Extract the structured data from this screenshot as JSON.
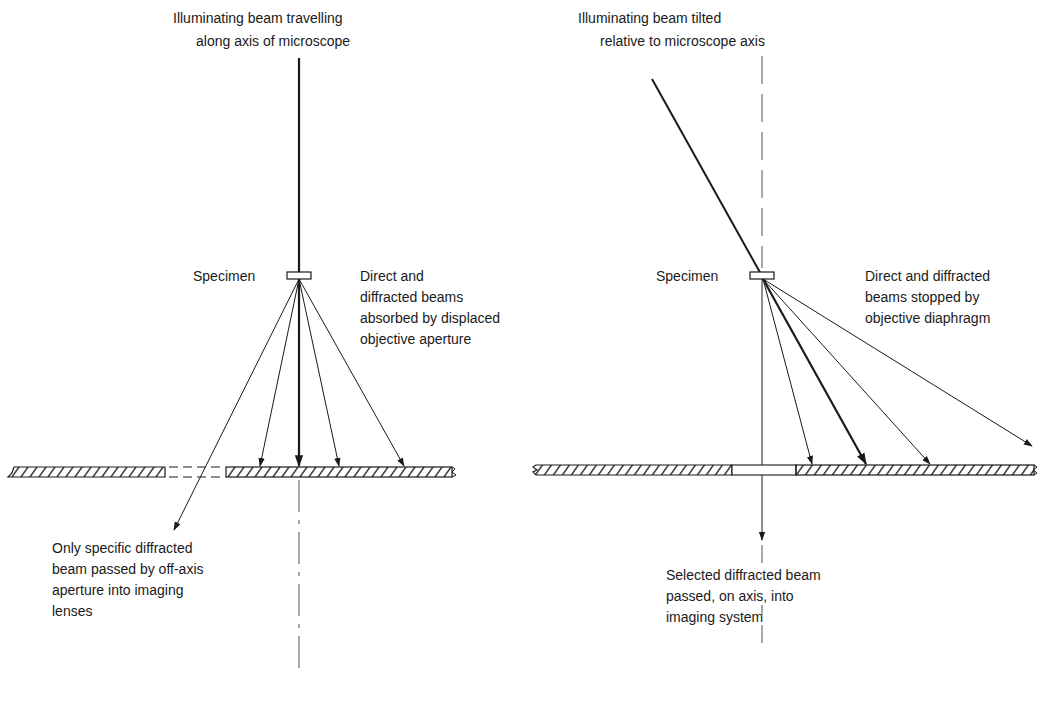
{
  "left_panel": {
    "title_line1": "Illuminating beam travelling",
    "title_line2": "along axis of microscope",
    "specimen_label": "Specimen",
    "absorbed_line1": "Direct and",
    "absorbed_line2": "diffracted beams",
    "absorbed_line3": "absorbed by displaced",
    "absorbed_line4": "objective aperture",
    "passed_line1": "Only specific diffracted",
    "passed_line2": "beam passed by off-axis",
    "passed_line3": "aperture into imaging",
    "passed_line4": "lenses"
  },
  "right_panel": {
    "title_line1": "Illuminating beam tilted",
    "title_line2": "relative to microscope axis",
    "specimen_label": "Specimen",
    "stopped_line1": "Direct and diffracted",
    "stopped_line2": "beams stopped by",
    "stopped_line3": "objective diaphragm",
    "passed_line1": "Selected diffracted beam",
    "passed_line2": "passed, on axis, into",
    "passed_line3": "imaging system"
  },
  "colors": {
    "ink": "#1a1a1a",
    "axis": "#555555",
    "background": "#ffffff"
  }
}
